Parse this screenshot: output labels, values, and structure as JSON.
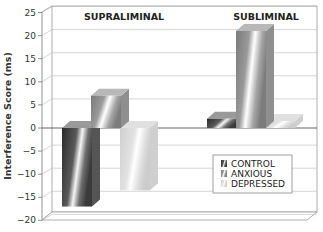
{
  "chart_data": {
    "type": "bar",
    "style": "3d-clustered",
    "title": "",
    "xlabel": "",
    "ylabel": "Interference Score (ms)",
    "ylim": [
      -20,
      25
    ],
    "yticks": [
      25,
      20,
      15,
      10,
      5,
      0,
      -5,
      -10,
      -15,
      -20
    ],
    "ytick_labels": [
      "25",
      "20",
      "15",
      "10",
      "5",
      "0",
      "−5",
      "−10",
      "−15",
      "−20"
    ],
    "grid": true,
    "categories": [
      "SUPRALIMINAL",
      "SUBLIMINAL"
    ],
    "series": [
      {
        "name": "CONTROL",
        "values": [
          -17,
          2
        ],
        "color": "#3a3a3a"
      },
      {
        "name": "ANXIOUS",
        "values": [
          7,
          21
        ],
        "color": "#8a8a8a"
      },
      {
        "name": "DEPRESSED",
        "values": [
          -13.5,
          1.5
        ],
        "color": "#d4d4d4"
      }
    ],
    "legend": {
      "position": "lower-right",
      "entries": [
        "CONTROL",
        "ANXIOUS",
        "DEPRESSED"
      ]
    },
    "caption_truncated": true
  },
  "labels": {
    "ylabel": "Interference Score (ms)",
    "group1": "SUPRALIMINAL",
    "group2": "SUBLIMINAL",
    "legend_control": "CONTROL",
    "legend_anxious": "ANXIOUS",
    "legend_depressed": "DEPRESSED",
    "ticks": [
      "25",
      "20",
      "15",
      "10",
      "5",
      "0",
      "−5",
      "−10",
      "−15",
      "−20"
    ]
  }
}
